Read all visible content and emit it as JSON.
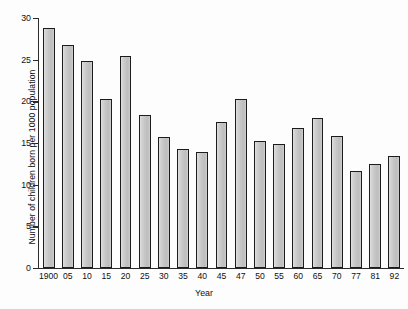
{
  "chart_data": {
    "type": "bar",
    "title": "",
    "xlabel": "Year",
    "ylabel": "Number of children born per 1000 population",
    "categories": [
      "1900",
      "05",
      "10",
      "15",
      "20",
      "25",
      "30",
      "35",
      "40",
      "45",
      "47",
      "50",
      "55",
      "60",
      "65",
      "70",
      "77",
      "81",
      "92"
    ],
    "values": [
      28.8,
      26.8,
      24.9,
      20.3,
      25.4,
      18.4,
      15.7,
      14.3,
      13.9,
      17.5,
      20.3,
      15.3,
      14.9,
      16.8,
      18.0,
      15.9,
      11.7,
      12.5,
      13.4
    ],
    "ylim": [
      0,
      30
    ],
    "yticks": [
      0,
      5,
      10,
      15,
      20,
      25,
      30
    ],
    "ytick_labels": [
      "0",
      "5",
      "10",
      "15",
      "20",
      "25",
      "30"
    ],
    "xlim_note": "categorical",
    "grid": false,
    "legend": null,
    "bar_fill_color": "#c8c8c8",
    "bar_edge_color": "#1c1c1c",
    "background_color": "#fdfdfd"
  }
}
